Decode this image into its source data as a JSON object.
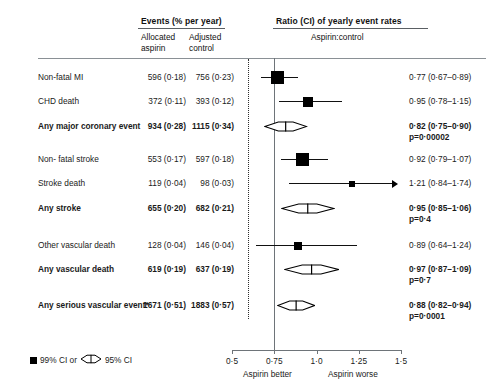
{
  "header": {
    "events_group": "Events (% per year)",
    "col_allocated": "Allocated\naspirin",
    "col_adjusted": "Adjusted\ncontrol",
    "ratio_group": "Ratio (CI) of yearly event rates",
    "ratio_sub": "Aspirin:control"
  },
  "axis": {
    "ticks": [
      "0·5",
      "0·75",
      "1·0",
      "1·25",
      "1·5"
    ],
    "tick_values": [
      0.5,
      0.75,
      1.0,
      1.25,
      1.5
    ],
    "left_note": "Aspirin better",
    "right_note": "Aspirin worse"
  },
  "legend": {
    "square_label": "99% CI or",
    "diamond_label": "95% CI"
  },
  "rows": [
    {
      "label": "Non-fatal MI",
      "bold": false,
      "allocated": "596 (0·18)",
      "adjusted": "756 (0·23)",
      "result": "0·77 (0·67–0·89)",
      "pvalue": "",
      "marker": "square",
      "estimate": 0.77,
      "ci_low": 0.67,
      "ci_high": 0.89,
      "size": 13
    },
    {
      "label": "CHD death",
      "bold": false,
      "allocated": "372 (0·11)",
      "adjusted": "393 (0·12)",
      "result": "0·95 (0·78–1·15)",
      "pvalue": "",
      "marker": "square",
      "estimate": 0.95,
      "ci_low": 0.78,
      "ci_high": 1.15,
      "size": 10
    },
    {
      "label": "Any major coronary event",
      "bold": true,
      "allocated": "934 (0·28)",
      "adjusted": "1115 (0·34)",
      "result": "0·82 (0·75–0·90)",
      "pvalue": "p=0·00002",
      "marker": "diamond",
      "estimate": 0.82,
      "ci_low": 0.75,
      "ci_high": 0.9,
      "size": 0
    },
    {
      "label": "Non- fatal stroke",
      "bold": false,
      "allocated": "553 (0·17)",
      "adjusted": "597 (0·18)",
      "result": "0·92 (0·79–1·07)",
      "pvalue": "",
      "marker": "square",
      "estimate": 0.92,
      "ci_low": 0.79,
      "ci_high": 1.07,
      "size": 13
    },
    {
      "label": "Stroke death",
      "bold": false,
      "allocated": "119 (0·04)",
      "adjusted": "98 (0·03)",
      "result": "1·21 (0·84–1·74)",
      "pvalue": "",
      "marker": "square-arrow",
      "estimate": 1.21,
      "ci_low": 0.84,
      "ci_high": 1.74,
      "size": 6
    },
    {
      "label": "Any stroke",
      "bold": true,
      "allocated": "655 (0·20)",
      "adjusted": "682 (0·21)",
      "result": "0·95 (0·85–1·06)",
      "pvalue": "p=0·4",
      "marker": "diamond",
      "estimate": 0.95,
      "ci_low": 0.85,
      "ci_high": 1.06,
      "size": 0
    },
    {
      "label": "Other vascular death",
      "bold": false,
      "allocated": "128 (0·04)",
      "adjusted": "146 (0·04)",
      "result": "0·89 (0·64–1·24)",
      "pvalue": "",
      "marker": "square",
      "estimate": 0.89,
      "ci_low": 0.64,
      "ci_high": 1.24,
      "size": 8
    },
    {
      "label": "Any vascular death",
      "bold": true,
      "allocated": "619 (0·19)",
      "adjusted": "637 (0·19)",
      "result": "0·97 (0·87–1·09)",
      "pvalue": "p=0·7",
      "marker": "diamond",
      "estimate": 0.97,
      "ci_low": 0.87,
      "ci_high": 1.09,
      "size": 0
    },
    {
      "label": "Any serious vascular event*",
      "bold": true,
      "allocated": "1671 (0·51)",
      "adjusted": "1883 (0·57)",
      "result": "0·88 (0·82–0·94)",
      "pvalue": "p=0·0001",
      "marker": "diamond",
      "estimate": 0.88,
      "ci_low": 0.82,
      "ci_high": 0.94,
      "size": 0
    }
  ],
  "chart_data": {
    "type": "forest",
    "title": "",
    "xlabel": "Ratio (CI) of yearly event rates — Aspirin:control",
    "xlim": [
      0.5,
      1.5
    ],
    "xscale": "linear",
    "reference_line": 1.0,
    "summary_line": 0.88,
    "grid": false,
    "categories": [
      "Non-fatal MI",
      "CHD death",
      "Any major coronary event",
      "Non- fatal stroke",
      "Stroke death",
      "Any stroke",
      "Other vascular death",
      "Any vascular death",
      "Any serious vascular event*"
    ],
    "estimates": [
      0.77,
      0.95,
      0.82,
      0.92,
      1.21,
      0.95,
      0.89,
      0.97,
      0.88
    ],
    "ci_low": [
      0.67,
      0.78,
      0.75,
      0.79,
      0.84,
      0.85,
      0.64,
      0.87,
      0.82
    ],
    "ci_high": [
      0.89,
      1.15,
      0.9,
      1.07,
      1.74,
      1.06,
      1.24,
      1.09,
      0.94
    ],
    "events_aspirin": [
      596,
      372,
      934,
      553,
      119,
      655,
      128,
      619,
      1671
    ],
    "rate_aspirin": [
      0.18,
      0.11,
      0.28,
      0.17,
      0.04,
      0.2,
      0.04,
      0.19,
      0.51
    ],
    "events_control": [
      756,
      393,
      1115,
      597,
      98,
      682,
      146,
      637,
      1883
    ],
    "rate_control": [
      0.23,
      0.12,
      0.34,
      0.18,
      0.03,
      0.21,
      0.04,
      0.19,
      0.57
    ],
    "pvalues": [
      "",
      "",
      "p=0·00002",
      "",
      "",
      "p=0·4",
      "",
      "p=0·7",
      "p=0·0001"
    ],
    "marker_types": [
      "square",
      "square",
      "diamond",
      "square",
      "square-arrow",
      "diamond",
      "square",
      "diamond",
      "diamond"
    ],
    "legend": [
      "99% CI or",
      "95% CI"
    ],
    "xtick_labels": [
      "0·5",
      "0·75",
      "1·0",
      "1·25",
      "1·5"
    ],
    "annotations": [
      "Aspirin better",
      "Aspirin worse"
    ]
  }
}
